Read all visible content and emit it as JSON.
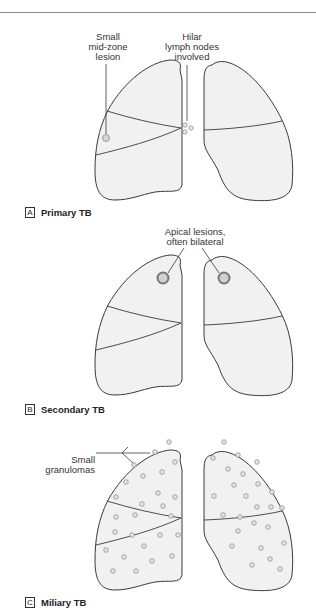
{
  "colors": {
    "outline": "#3a3a3a",
    "fill": "#f1f1f1",
    "lesion_fill": "#d6d6d6",
    "lesion_ring": "#8a8a8a"
  },
  "panels": [
    {
      "id": "A",
      "letter": "A",
      "title": "Primary TB",
      "callouts": [
        {
          "text": "Small\nmid-zone\nlesion"
        },
        {
          "text": "Hilar\nlymph nodes\ninvolved"
        }
      ]
    },
    {
      "id": "B",
      "letter": "B",
      "title": "Secondary TB",
      "callouts": [
        {
          "text": "Apical lesions,\noften bilateral"
        }
      ]
    },
    {
      "id": "C",
      "letter": "C",
      "title": "Miliary TB",
      "callouts": [
        {
          "text": "Small\ngranulomas"
        }
      ]
    }
  ],
  "granulomas": {
    "left": [
      [
        169,
        52
      ],
      [
        155,
        62
      ],
      [
        175,
        72
      ],
      [
        134,
        75
      ],
      [
        162,
        82
      ],
      [
        143,
        86
      ],
      [
        126,
        92
      ],
      [
        158,
        103
      ],
      [
        175,
        107
      ],
      [
        116,
        107
      ],
      [
        142,
        114
      ],
      [
        163,
        116
      ],
      [
        116,
        127
      ],
      [
        135,
        125
      ],
      [
        171,
        126
      ],
      [
        115,
        142
      ],
      [
        132,
        145
      ],
      [
        160,
        145
      ],
      [
        178,
        145
      ],
      [
        144,
        156
      ],
      [
        106,
        160
      ],
      [
        124,
        167
      ],
      [
        152,
        171
      ],
      [
        172,
        166
      ],
      [
        113,
        181
      ],
      [
        136,
        181
      ]
    ],
    "right": [
      [
        224,
        52
      ],
      [
        213,
        68
      ],
      [
        238,
        65
      ],
      [
        257,
        72
      ],
      [
        228,
        79
      ],
      [
        243,
        84
      ],
      [
        234,
        95
      ],
      [
        258,
        94
      ],
      [
        214,
        106
      ],
      [
        246,
        106
      ],
      [
        272,
        102
      ],
      [
        257,
        117
      ],
      [
        271,
        117
      ],
      [
        282,
        118
      ],
      [
        223,
        125
      ],
      [
        240,
        127
      ],
      [
        254,
        133
      ],
      [
        268,
        137
      ],
      [
        238,
        141
      ],
      [
        284,
        153
      ],
      [
        232,
        156
      ],
      [
        261,
        158
      ],
      [
        270,
        169
      ],
      [
        252,
        175
      ],
      [
        280,
        179
      ]
    ]
  }
}
